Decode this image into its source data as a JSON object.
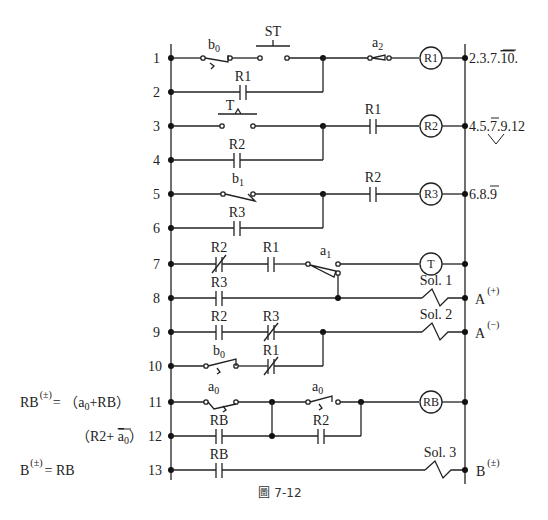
{
  "figure": {
    "caption": "圖 7-12",
    "footer_text_cut_off": ""
  },
  "rails": {
    "left_x": 171,
    "right_x": 465
  },
  "rungs": [
    {
      "num": "1",
      "y": 58,
      "contacts": [
        {
          "label": "b₀",
          "type": "limit-switch-nc"
        },
        {
          "label": "ST",
          "type": "pushbutton-no"
        },
        {
          "label": "a₂",
          "type": "limit-switch-no"
        }
      ],
      "output": {
        "type": "coil",
        "label": "R1"
      },
      "note": "2.3.7.10̄."
    },
    {
      "num": "2",
      "y": 92,
      "contacts": [
        {
          "label": "R1",
          "type": "no-contact"
        }
      ]
    },
    {
      "num": "3",
      "y": 126,
      "contacts": [
        {
          "label": "T",
          "type": "timer-contact-no"
        },
        {
          "label": "R1",
          "type": "no-contact"
        }
      ],
      "output": {
        "type": "coil",
        "label": "R2"
      },
      "note": "4.5.7̄.9.12"
    },
    {
      "num": "4",
      "y": 160,
      "contacts": [
        {
          "label": "R2",
          "type": "no-contact"
        }
      ]
    },
    {
      "num": "5",
      "y": 194,
      "contacts": [
        {
          "label": "b₁",
          "type": "limit-switch-no"
        },
        {
          "label": "R2",
          "type": "no-contact"
        }
      ],
      "output": {
        "type": "coil",
        "label": "R3"
      },
      "note": "6.8.9̄"
    },
    {
      "num": "6",
      "y": 228,
      "contacts": [
        {
          "label": "R3",
          "type": "no-contact"
        }
      ]
    },
    {
      "num": "7",
      "y": 264,
      "contacts": [
        {
          "label": "R2",
          "type": "nc-contact"
        },
        {
          "label": "R1",
          "type": "no-contact"
        },
        {
          "label": "a₁",
          "type": "limit-switch-changeover"
        }
      ],
      "output": {
        "type": "coil",
        "label": "T"
      }
    },
    {
      "num": "8",
      "y": 298,
      "contacts": [
        {
          "label": "R3",
          "type": "no-contact"
        }
      ],
      "output": {
        "type": "solenoid",
        "label": "Sol. 1"
      },
      "note": "A(+)"
    },
    {
      "num": "9",
      "y": 332,
      "contacts": [
        {
          "label": "R2",
          "type": "no-contact"
        },
        {
          "label": "R3",
          "type": "nc-contact"
        }
      ],
      "output": {
        "type": "solenoid",
        "label": "Sol. 2"
      },
      "note": "A(−)"
    },
    {
      "num": "10",
      "y": 366,
      "contacts": [
        {
          "label": "b₀",
          "type": "limit-switch-no"
        },
        {
          "label": "R1",
          "type": "nc-contact"
        }
      ]
    },
    {
      "num": "11",
      "y": 402,
      "contacts": [
        {
          "label": "a₀",
          "type": "limit-switch-nc"
        },
        {
          "label": "a₀",
          "type": "limit-switch-no"
        }
      ],
      "output": {
        "type": "coil",
        "label": "RB"
      }
    },
    {
      "num": "12",
      "y": 436,
      "contacts": [
        {
          "label": "RB",
          "type": "no-contact"
        },
        {
          "label": "R2",
          "type": "no-contact"
        }
      ]
    },
    {
      "num": "13",
      "y": 470,
      "contacts": [
        {
          "label": "RB",
          "type": "no-contact"
        }
      ],
      "output": {
        "type": "solenoid",
        "label": "Sol. 3"
      },
      "note": "B(±)"
    }
  ],
  "labels": {
    "st": "ST",
    "b0": "b",
    "b0_sub": "0",
    "a2": "a",
    "a2_sub": "2",
    "r1": "R1",
    "r2": "R2",
    "r3": "R3",
    "t": "T",
    "rb": "RB",
    "b1": "b",
    "b1_sub": "1",
    "a1": "a",
    "a1_sub": "1",
    "a0": "a",
    "a0_sub": "0",
    "sol1": "Sol. 1",
    "sol2": "Sol. 2",
    "sol3": "Sol. 3",
    "coil_r1": "R1",
    "coil_r2": "R2",
    "coil_r3": "R3",
    "coil_t": "T",
    "coil_rb": "RB"
  },
  "notes": {
    "row1_a": "2.3.7.",
    "row1_b": "10",
    "row1_c": ".",
    "row3_a": "4.5.",
    "row3_b": "7",
    "row3_c": ".9.12",
    "row5_a": "6.8.",
    "row5_b": "9",
    "row8": "A",
    "row8_sup": "(+)",
    "row9": "A",
    "row9_sup": "(−)",
    "row13": "B",
    "row13_sup": "(±)"
  },
  "equations": {
    "eq1_lhs": "RB",
    "eq1_sup": "(±)",
    "eq1_rhs_a": "= （a",
    "eq1_rhs_sub": "0",
    "eq1_rhs_b": "+RB）",
    "eq2_a": "（R2+ ",
    "eq2_bar": "a",
    "eq2_sub": "0",
    "eq2_b": "）",
    "eq3_lhs": "B",
    "eq3_sup": "(±)",
    "eq3_rhs": "=  RB"
  },
  "colors": {
    "line": "#222222",
    "background": "#ffffff"
  }
}
